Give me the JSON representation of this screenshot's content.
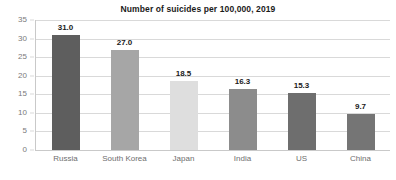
{
  "chart_data": {
    "type": "bar",
    "title": "Number of suicides per 100,000, 2019",
    "xlabel": "",
    "ylabel": "",
    "categories": [
      "Russia",
      "South Korea",
      "Japan",
      "India",
      "US",
      "China"
    ],
    "values": [
      31.0,
      27.0,
      18.5,
      16.3,
      15.3,
      9.7
    ],
    "value_labels": [
      "31.0",
      "27.0",
      "18.5",
      "16.3",
      "15.3",
      "9.7"
    ],
    "bar_colors": [
      "#5e5e5e",
      "#a6a6a6",
      "#dedede",
      "#8c8c8c",
      "#6e6e6e",
      "#757575"
    ],
    "ylim": [
      0,
      35
    ],
    "ytick_values": [
      0,
      5,
      10,
      15,
      20,
      25,
      30,
      35
    ],
    "ytick_labels": [
      "0",
      "5",
      "10",
      "15",
      "20",
      "25",
      "30",
      "35"
    ],
    "grid": true,
    "grid_axis": "y",
    "grid_color": "#d9d9d9",
    "legend": false,
    "legend_position": "none",
    "background_color": "#ffffff",
    "title_color": "#1a1a1a",
    "tick_label_color": "#7a7a7a",
    "data_label_color": "#1a1a1a"
  }
}
